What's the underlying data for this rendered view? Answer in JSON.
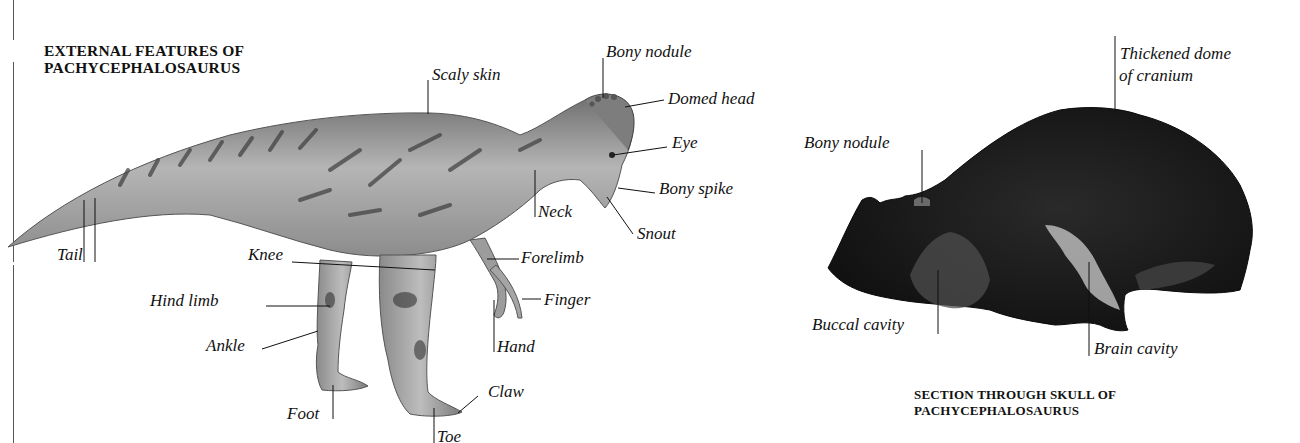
{
  "left_panel": {
    "title_line1": "EXTERNAL FEATURES OF",
    "title_line2": "PACHYCEPHALOSAURUS",
    "labels": {
      "scaly_skin": "Scaly skin",
      "bony_nodule": "Bony nodule",
      "domed_head": "Domed head",
      "eye": "Eye",
      "bony_spike": "Bony spike",
      "neck": "Neck",
      "snout": "Snout",
      "tail": "Tail",
      "knee": "Knee",
      "forelimb": "Forelimb",
      "hind_limb": "Hind limb",
      "finger": "Finger",
      "hand": "Hand",
      "ankle": "Ankle",
      "claw": "Claw",
      "foot": "Foot",
      "toe": "Toe"
    }
  },
  "right_panel": {
    "title_line1": "SECTION THROUGH SKULL OF",
    "title_line2": "PACHYCEPHALOSAURUS",
    "labels": {
      "thickened_dome_line1": "Thickened dome",
      "thickened_dome_line2": "of cranium",
      "bony_nodule": "Bony nodule",
      "buccal_cavity": "Buccal cavity",
      "brain_cavity": "Brain cavity"
    }
  },
  "colors": {
    "background": "#ffffff",
    "text": "#111111",
    "dino_skin": "#9a9a9a",
    "skull": "#1a1a1a"
  }
}
